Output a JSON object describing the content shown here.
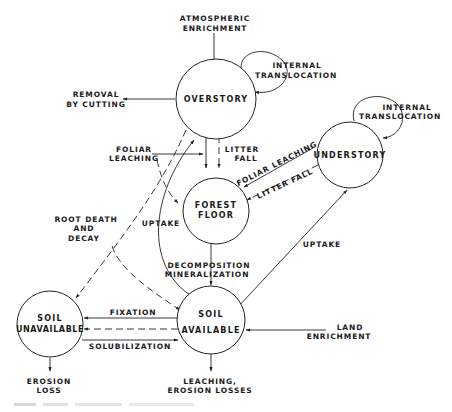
{
  "diagram": {
    "nodes": {
      "overstory": {
        "label": "OVERSTORY"
      },
      "forest_floor": {
        "line1": "FOREST",
        "line2": "FLOOR"
      },
      "understory": {
        "label": "UNDERSTORY"
      },
      "soil_unavailable": {
        "line1": "SOIL",
        "line2": "UNAVAILABLE"
      },
      "soil_available": {
        "line1": "SOIL",
        "line2": "AVAILABLE"
      }
    },
    "flows": {
      "atmospheric_enrichment": {
        "line1": "ATMOSPHERIC",
        "line2": "ENRICHMENT"
      },
      "overstory_internal_translocation": {
        "line1": "INTERNAL",
        "line2": "TRANSLOCATION"
      },
      "removal_by_cutting": {
        "line1": "REMOVAL",
        "line2": "BY CUTTING"
      },
      "overstory_foliar_leaching": {
        "line1": "FOLIAR",
        "line2": "LEACHING"
      },
      "overstory_litter_fall": {
        "line1": "LITTER",
        "line2": "FALL"
      },
      "understory_internal_translocation": {
        "line1": "INTERNAL",
        "line2": "TRANSLOCATION"
      },
      "understory_foliar_leaching": {
        "label": "FOLIAR LEACHING"
      },
      "understory_litter_fall": {
        "label": "LITTER FALL"
      },
      "root_death_decay": {
        "line1": "ROOT DEATH",
        "line2": "AND",
        "line3": "DECAY"
      },
      "overstory_uptake": {
        "label": "UPTAKE"
      },
      "decomposition": {
        "line1": "DECOMPOSITION",
        "line2": "MINERALIZATION"
      },
      "understory_uptake": {
        "label": "UPTAKE"
      },
      "fixation": {
        "label": "FIXATION"
      },
      "solubilization": {
        "label": "SOLUBILIZATION"
      },
      "land_enrichment": {
        "line1": "LAND",
        "line2": "ENRICHMENT"
      },
      "erosion_loss": {
        "line1": "EROSION",
        "line2": "LOSS"
      },
      "leaching_erosion_losses": {
        "line1": "LEACHING,",
        "line2": "EROSION LOSSES"
      }
    },
    "colors": {
      "ink": "#222222",
      "background": "#ffffff"
    }
  }
}
